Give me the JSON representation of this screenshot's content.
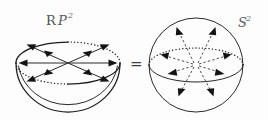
{
  "figure": {
    "title_left": "RP2",
    "title_right": "S2",
    "relation": "=",
    "background_color": "#fdfdfd",
    "ink_color": "#1c1c1c",
    "label_color": "#5a5a5a",
    "left_label": {
      "blackboard_symbol": "R",
      "italic_symbol": "P",
      "superscript": "2"
    },
    "right_label": {
      "italic_symbol": "S",
      "superscript": "2"
    },
    "left_shape": {
      "name": "hemisphere-bowl",
      "center_x": 68,
      "center_y": 63,
      "rim_rx": 52,
      "rim_ry": 21,
      "bowl_depth": 49,
      "arrow_count": 6,
      "arrow_style": "solid-double-headed",
      "rim_arcs": [
        {
          "segment": "top-left",
          "style": "solid"
        },
        {
          "segment": "top-right",
          "style": "dotted"
        },
        {
          "segment": "bottom-left",
          "style": "dotted"
        },
        {
          "segment": "bottom-right",
          "style": "solid"
        }
      ]
    },
    "right_shape": {
      "name": "sphere",
      "center_x": 196,
      "center_y": 65,
      "radius": 47,
      "equator_rx": 47,
      "equator_ry": 17,
      "arrow_count": 8,
      "arrow_style": "dashed-radial",
      "equator_arcs": [
        {
          "segment": "back-upper",
          "style": "dotted"
        },
        {
          "segment": "front-lower",
          "style": "solid"
        }
      ]
    }
  }
}
